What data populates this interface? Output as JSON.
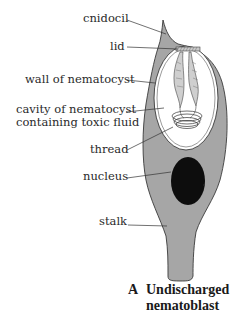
{
  "figure": {
    "title_letter": "A",
    "title_line1": "Undischarged",
    "title_line2": "nematoblast",
    "labels": {
      "cnidocil": "cnidocil",
      "lid": "lid",
      "wall": "wall of nematocyst",
      "cavity_line1": "cavity of nematocyst",
      "cavity_line2": "containing toxic fluid",
      "thread": "thread",
      "nucleus": "nucleus",
      "stalk": "stalk"
    },
    "colors": {
      "cell_fill": "#a6a6a6",
      "cell_outline": "#3a3a3a",
      "capsule_fill": "#ffffff",
      "nucleus_fill": "#0d0d0d",
      "leader_line": "#333333"
    }
  }
}
